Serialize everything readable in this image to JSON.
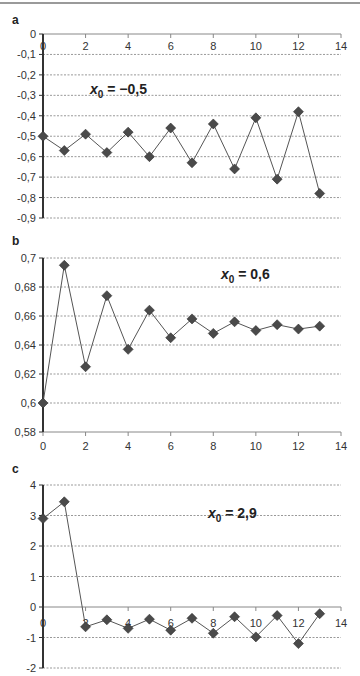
{
  "chart_data": [
    {
      "panel": "a",
      "type": "line",
      "annotation": "x0 = −0,5",
      "x": [
        0,
        1,
        2,
        3,
        4,
        5,
        6,
        7,
        8,
        9,
        10,
        11,
        12,
        13
      ],
      "values": [
        -0.5,
        -0.57,
        -0.49,
        -0.58,
        -0.48,
        -0.6,
        -0.46,
        -0.63,
        -0.44,
        -0.66,
        -0.41,
        -0.71,
        -0.38,
        -0.78
      ],
      "xlim": [
        0,
        14
      ],
      "ylim": [
        -0.9,
        0
      ],
      "xticks": [
        "0",
        "2",
        "4",
        "6",
        "8",
        "10",
        "12",
        "14"
      ],
      "yticks": [
        "0",
        "-0,1",
        "-0,2",
        "-0,3",
        "-0,4",
        "-0,5",
        "-0,6",
        "-0,7",
        "-0,8",
        "-0,9"
      ],
      "grid": true,
      "marker": "diamond"
    },
    {
      "panel": "b",
      "type": "line",
      "annotation": "x0 = 0,6",
      "x": [
        0,
        1,
        2,
        3,
        4,
        5,
        6,
        7,
        8,
        9,
        10,
        11,
        12,
        13
      ],
      "values": [
        0.6,
        0.695,
        0.625,
        0.674,
        0.637,
        0.664,
        0.645,
        0.658,
        0.648,
        0.656,
        0.65,
        0.654,
        0.651,
        0.653
      ],
      "xlim": [
        0,
        14
      ],
      "ylim": [
        0.58,
        0.7
      ],
      "xticks": [
        "0",
        "2",
        "4",
        "6",
        "8",
        "10",
        "12",
        "14"
      ],
      "yticks": [
        "0,7",
        "0,68",
        "0,66",
        "0,64",
        "0,62",
        "0,6",
        "0,58"
      ],
      "grid": true,
      "marker": "diamond"
    },
    {
      "panel": "c",
      "type": "line",
      "annotation": "x0 = 2,9",
      "x": [
        0,
        1,
        2,
        3,
        4,
        5,
        6,
        7,
        8,
        9,
        10,
        11,
        12,
        13
      ],
      "values": [
        2.9,
        3.45,
        -0.65,
        -0.42,
        -0.7,
        -0.4,
        -0.76,
        -0.37,
        -0.86,
        -0.32,
        -0.98,
        -0.28,
        -1.2,
        -0.22
      ],
      "xlim": [
        0,
        14
      ],
      "ylim": [
        -2,
        4
      ],
      "xticks": [
        "0",
        "2",
        "4",
        "6",
        "8",
        "10",
        "12",
        "14"
      ],
      "yticks": [
        "4",
        "3",
        "2",
        "1",
        "0",
        "-1",
        "-2"
      ],
      "grid": true,
      "marker": "diamond"
    }
  ],
  "panels": {
    "a": {
      "label": "a",
      "annot_var": "x",
      "annot_sub": "0",
      "annot_val": " = −0,5"
    },
    "b": {
      "label": "b",
      "annot_var": "x",
      "annot_sub": "0",
      "annot_val": " = 0,6"
    },
    "c": {
      "label": "c",
      "annot_var": "x",
      "annot_sub": "0",
      "annot_val": " = 2,9"
    }
  },
  "colors": {
    "line": "#555555",
    "marker": "#4a4a4a",
    "grid": "#999999",
    "axis": "#333333"
  }
}
